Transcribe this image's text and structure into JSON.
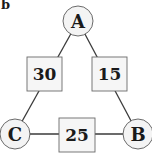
{
  "panel": {
    "label": "b"
  },
  "nodes": [
    {
      "id": "A",
      "label": "A",
      "cx": 78,
      "cy": 21,
      "r": 15
    },
    {
      "id": "B",
      "label": "B",
      "cx": 138,
      "cy": 134,
      "r": 15
    },
    {
      "id": "C",
      "label": "C",
      "cx": 15,
      "cy": 134,
      "r": 15
    }
  ],
  "edges": [
    {
      "from": "A",
      "to": "C",
      "weight": "30",
      "box": {
        "x": 27,
        "y": 57,
        "w": 35,
        "h": 34
      }
    },
    {
      "from": "A",
      "to": "B",
      "weight": "15",
      "box": {
        "x": 92,
        "y": 57,
        "w": 35,
        "h": 34
      }
    },
    {
      "from": "C",
      "to": "B",
      "weight": "25",
      "box": {
        "x": 59,
        "y": 118,
        "w": 36,
        "h": 34
      }
    }
  ],
  "colors": {
    "stroke": "#3a3a3a",
    "node_fill": "#f4f4f4",
    "box_fill": "#f6f6f6",
    "text": "#1a1a1a"
  }
}
